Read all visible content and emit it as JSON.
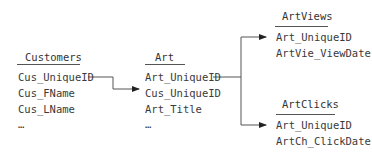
{
  "tables": {
    "customers": {
      "title": "Customers",
      "fields": [
        "Cus_UniqueID",
        "Cus_FName",
        "Cus_LName",
        "…"
      ]
    },
    "art": {
      "title": "Art",
      "fields": [
        "Art_UniqueID",
        "Cus_UniqueID",
        "Art_Title",
        "…"
      ]
    },
    "artviews": {
      "title": "ArtViews",
      "fields": [
        "Art_UniqueID",
        "ArtVie_ViewDate"
      ]
    },
    "artclicks": {
      "title": "ArtClicks",
      "fields": [
        "Art_UniqueID",
        "ArtCh_ClickDate"
      ]
    }
  },
  "relationships": [
    {
      "from": "Customers.Cus_UniqueID",
      "to": "Art.Cus_UniqueID"
    },
    {
      "from": "Art.Art_UniqueID",
      "to": "ArtViews.Art_UniqueID"
    },
    {
      "from": "Art.Art_UniqueID",
      "to": "ArtClicks.Art_UniqueID"
    }
  ],
  "colors": {
    "line": "#555555",
    "text": "#3a3a3a"
  }
}
